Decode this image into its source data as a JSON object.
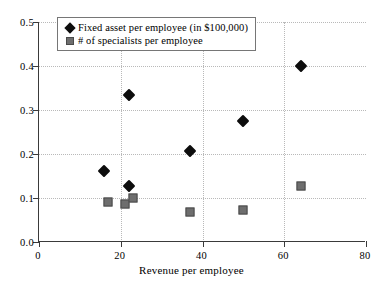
{
  "chart_data": {
    "type": "scatter",
    "title": "",
    "xlabel": "Revenue per employee",
    "ylabel": "",
    "xlim": [
      0,
      80
    ],
    "ylim": [
      0,
      0.5
    ],
    "xticks": [
      0,
      20,
      40,
      60,
      80
    ],
    "yticks": [
      "0.0",
      "0.1",
      "0.2",
      "0.3",
      "0.4",
      "0.5"
    ],
    "grid": true,
    "legend_position": "top-left-inside",
    "series": [
      {
        "name": "Fixed asset per employee (in $100,000)",
        "marker": "diamond",
        "color": "#0d0d0d",
        "points": [
          {
            "x": 16,
            "y": 0.162
          },
          {
            "x": 22,
            "y": 0.335
          },
          {
            "x": 22,
            "y": 0.128
          },
          {
            "x": 37,
            "y": 0.207
          },
          {
            "x": 50,
            "y": 0.275
          },
          {
            "x": 64,
            "y": 0.4
          }
        ]
      },
      {
        "name": "# of specialists per employee",
        "marker": "square",
        "color": "#6e6e6e",
        "points": [
          {
            "x": 17,
            "y": 0.09
          },
          {
            "x": 21,
            "y": 0.086
          },
          {
            "x": 23,
            "y": 0.1
          },
          {
            "x": 37,
            "y": 0.069
          },
          {
            "x": 50,
            "y": 0.073
          },
          {
            "x": 64,
            "y": 0.128
          }
        ]
      }
    ]
  },
  "legend": {
    "items": [
      {
        "label": "Fixed asset per employee (in $100,000)",
        "marker": "diamond-marker-icon"
      },
      {
        "label": "# of specialists per employee",
        "marker": "square-marker-icon"
      }
    ]
  },
  "axes": {
    "x_title": "Revenue per employee",
    "x_tick_labels": [
      "0",
      "20",
      "40",
      "60",
      "80"
    ],
    "y_tick_labels": [
      "0.0",
      "0.1",
      "0.2",
      "0.3",
      "0.4",
      "0.5"
    ]
  }
}
